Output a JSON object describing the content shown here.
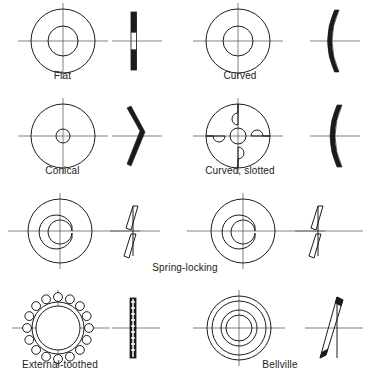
{
  "figure": {
    "title": "",
    "background_color": "#ffffff",
    "line_color": "#1b1b1b",
    "centerline_color": "#4a4a4a",
    "columns": 2,
    "rows": 4
  },
  "items": [
    {
      "id": "flat",
      "label": "Flat",
      "plan_view": "annulus",
      "side_view": "straight-flat-section",
      "column": "left",
      "row": 1
    },
    {
      "id": "curved",
      "label": "Curved",
      "plan_view": "annulus",
      "side_view": "crescent-arc-section",
      "column": "right",
      "row": 1
    },
    {
      "id": "conical",
      "label": "Conical",
      "plan_view": "annulus-small-bore",
      "side_view": "chevron-bent-section",
      "column": "left",
      "row": 2
    },
    {
      "id": "curved-slotted",
      "label": "Curved, slotted",
      "plan_view": "annulus-four-slots",
      "side_view": "crescent-arc-section",
      "column": "right",
      "row": 2
    },
    {
      "id": "spring-locking-left",
      "label": "",
      "plan_view": "split-ring",
      "side_view": "split-offset-section",
      "column": "left",
      "row": 3
    },
    {
      "id": "spring-locking-right",
      "label": "",
      "plan_view": "split-ring",
      "side_view": "split-offset-section",
      "column": "right",
      "row": 3
    },
    {
      "id": "external-toothed",
      "label": "External-toothed",
      "plan_view": "gear-toothed-ring",
      "side_view": "segmented-ladder-section",
      "column": "left",
      "row": 4
    },
    {
      "id": "bellville",
      "label": "Bellville",
      "plan_view": "concentric-rings",
      "side_view": "tapered-cone-section",
      "column": "right",
      "row": 4
    }
  ],
  "shared_labels": [
    {
      "id": "spring-locking",
      "text": "Spring-locking",
      "spans": "both-columns",
      "row": 3
    }
  ]
}
